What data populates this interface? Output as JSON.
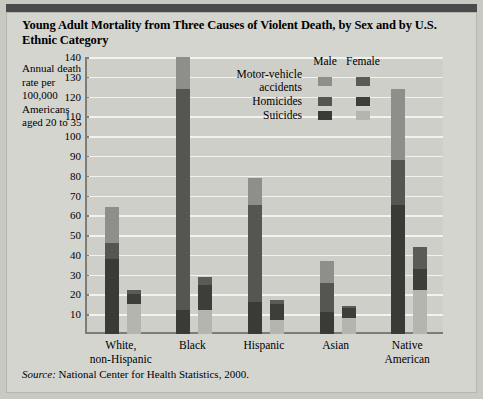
{
  "title": "Young Adult Mortality from Three Causes of Violent Death, by Sex and by U.S. Ethnic Category",
  "axis_label_block": "Annual death rate per 100,000 Americans aged 20 to 35",
  "source_prefix": "Source:",
  "source_text": "National Center for Health Statistics, 2000.",
  "legend": {
    "col_male": "Male",
    "col_female": "Female",
    "rows": [
      {
        "label": "Motor-vehicle accidents",
        "male_color": "#8e8e8a",
        "female_color": "#5a5a56"
      },
      {
        "label": "Homicides",
        "male_color": "#555551",
        "female_color": "#3d3d39"
      },
      {
        "label": "Suicides",
        "male_color": "#3a3a36",
        "female_color": "#b5b5b0"
      }
    ]
  },
  "colors": {
    "panel": "#d5d5d0",
    "plot_bg": "#cfcfca",
    "grid": "#f2f2ee",
    "axis": "#7d7d78",
    "topbar": "#4a4a4a",
    "motor_male": "#8e8e8a",
    "motor_female": "#5a5a56",
    "homicide_male": "#555551",
    "homicide_female": "#3d3d39",
    "suicide_male": "#3a3a36",
    "suicide_female": "#b5b5b0"
  },
  "chart_data": {
    "type": "bar",
    "title": "Young Adult Mortality from Three Causes of Violent Death, by Sex and by U.S. Ethnic Category",
    "xlabel": "",
    "ylabel": "Annual death rate per 100,000 Americans aged 20 to 35",
    "ylim": [
      0,
      140
    ],
    "yticks": [
      10,
      20,
      30,
      40,
      50,
      60,
      70,
      80,
      90,
      100,
      110,
      120,
      130,
      140
    ],
    "grid": true,
    "stacked": true,
    "legend_position": "inside-top-right",
    "categories": [
      "White, non-Hispanic",
      "Black",
      "Hispanic",
      "Asian",
      "Native American"
    ],
    "category_labels_two_line": [
      [
        "White,",
        "non-Hispanic"
      ],
      [
        "Black",
        ""
      ],
      [
        "Hispanic",
        ""
      ],
      [
        "Asian",
        ""
      ],
      [
        "Native",
        "American"
      ]
    ],
    "series": [
      {
        "name": "Suicides",
        "sex": "Male",
        "values": [
          38,
          12,
          16,
          11,
          65
        ]
      },
      {
        "name": "Homicides",
        "sex": "Male",
        "values": [
          8,
          112,
          49,
          15,
          23
        ]
      },
      {
        "name": "Motor-vehicle accidents",
        "sex": "Male",
        "values": [
          18,
          16,
          14,
          11,
          36
        ]
      },
      {
        "name": "Suicides",
        "sex": "Female",
        "values": [
          15,
          12,
          7,
          8,
          22
        ]
      },
      {
        "name": "Homicides",
        "sex": "Female",
        "values": [
          5,
          13,
          8,
          5,
          11
        ]
      },
      {
        "name": "Motor-vehicle accidents",
        "sex": "Female",
        "values": [
          2,
          4,
          2,
          1,
          11
        ]
      }
    ],
    "totals_male": [
      64,
      140,
      79,
      37,
      124
    ],
    "totals_female": [
      22,
      29,
      17,
      14,
      44
    ]
  }
}
